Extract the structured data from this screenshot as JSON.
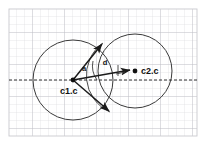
{
  "figure": {
    "background_color": "#ffffff",
    "grid": {
      "visible": true,
      "minor_color": "#d8d8dc",
      "major_color": "#b9b9c0",
      "cell_size": 8,
      "x_start": 9,
      "y_start": 9,
      "x_end": 197,
      "y_end": 136,
      "major_every": 4
    },
    "frame": {
      "visible": true,
      "color": "#c9c9cf"
    },
    "axis_line": {
      "name": "horizontal-dashed-axis",
      "style": "dashed",
      "color": "#1a1a1a",
      "y": 80,
      "x_start": 9,
      "x_end": 197,
      "dash": "3,2"
    },
    "circles": [
      {
        "name": "circle-c1",
        "cx": 73,
        "cy": 80,
        "r": 40,
        "stroke": "#3a3a3a",
        "fill": "none"
      },
      {
        "name": "circle-c2",
        "cx": 135,
        "cy": 71,
        "r": 37,
        "stroke": "#3a3a3a",
        "fill": "none"
      }
    ],
    "points": [
      {
        "name": "point-c1-center",
        "label": "c1.c",
        "cx": 73,
        "cy": 80,
        "r": 2.4,
        "label_x": 61,
        "label_y": 93,
        "color": "#111111"
      },
      {
        "name": "point-c2-center",
        "label": "c2.c",
        "cx": 135,
        "cy": 71,
        "r": 2.4,
        "label_x": 141,
        "label_y": 74,
        "color": "#111111"
      }
    ],
    "vectors": [
      {
        "name": "vector-upper-intersection",
        "x1": 73,
        "y1": 80,
        "x2": 103,
        "y2": 43,
        "color": "#1a1a1a",
        "width": 1.5
      },
      {
        "name": "vector-distance-d",
        "x1": 73,
        "y1": 80,
        "x2": 131,
        "y2": 70,
        "color": "#1a1a1a",
        "width": 1.5
      },
      {
        "name": "vector-lower-intersection",
        "x1": 73,
        "y1": 80,
        "x2": 110,
        "y2": 112,
        "color": "#1a1a1a",
        "width": 1.5
      }
    ],
    "arcs": [
      {
        "name": "angle-arc-a",
        "d": "M 95 63 A 28 28 0 0 0 101 79",
        "color": "#3a3a3a"
      },
      {
        "name": "chord-arc-intersections",
        "d": "M 103 43 A 40 40 0 0 0 110 112",
        "color": "#3a3a3a"
      }
    ],
    "right_angle_marker": {
      "name": "right-angle-marker",
      "d": "M 118 66 L 118 76 L 126 73",
      "color": "#3a3a3a"
    },
    "annotations": [
      {
        "name": "angle-label-a",
        "text": "a",
        "x": 84,
        "y": 70,
        "size": 7.5
      },
      {
        "name": "distance-label-d",
        "text": "d",
        "x": 104,
        "y": 64,
        "size": 7.5
      }
    ]
  }
}
